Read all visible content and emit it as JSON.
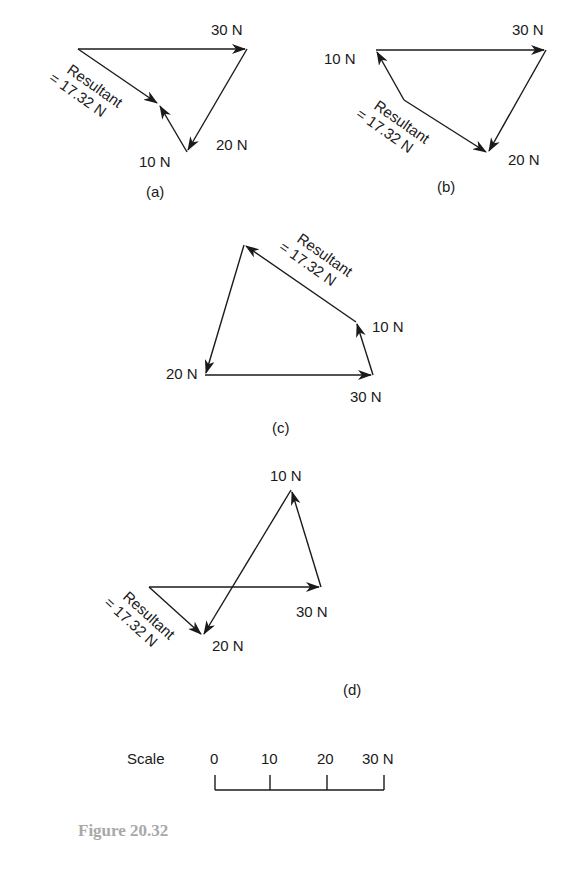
{
  "figure": {
    "caption": "Figure 20.32",
    "caption_color": "#a8a8a8"
  },
  "panels": [
    {
      "id": "a",
      "label": "(a)",
      "forces": [
        {
          "name": "30 N",
          "label": "30 N"
        },
        {
          "name": "20 N",
          "label": "20 N"
        },
        {
          "name": "10 N",
          "label": "10 N"
        }
      ],
      "resultant": {
        "line1": "Resultant",
        "line2": "= 17.32 N"
      }
    },
    {
      "id": "b",
      "label": "(b)",
      "forces": [
        {
          "name": "30 N",
          "label": "30 N"
        },
        {
          "name": "20 N",
          "label": "20 N"
        },
        {
          "name": "10 N",
          "label": "10 N"
        }
      ],
      "resultant": {
        "line1": "Resultant",
        "line2": "= 17.32 N"
      }
    },
    {
      "id": "c",
      "label": "(c)",
      "forces": [
        {
          "name": "30 N",
          "label": "30 N"
        },
        {
          "name": "20 N",
          "label": "20 N"
        },
        {
          "name": "10 N",
          "label": "10 N"
        }
      ],
      "resultant": {
        "line1": "Resultant",
        "line2": "= 17.32 N"
      }
    },
    {
      "id": "d",
      "label": "(d)",
      "forces": [
        {
          "name": "30 N",
          "label": "30 N"
        },
        {
          "name": "20 N",
          "label": "20 N"
        },
        {
          "name": "10 N",
          "label": "10 N"
        }
      ],
      "resultant": {
        "line1": "Resultant",
        "line2": "= 17.32 N"
      }
    }
  ],
  "scale": {
    "title": "Scale",
    "ticks": [
      "0",
      "10",
      "20",
      "30 N"
    ]
  }
}
